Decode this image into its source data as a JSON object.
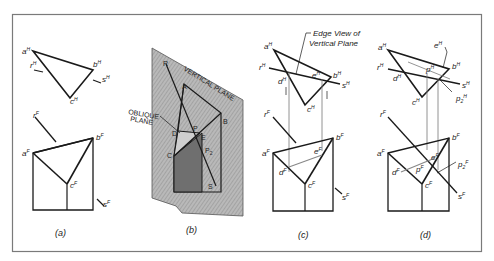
{
  "figure": {
    "frame": {
      "x": 12,
      "y": 14,
      "width": 470,
      "height": 238,
      "stroke": "#777777"
    },
    "panels": [
      {
        "id": "a",
        "caption": "(a)",
        "horizontal_view": {
          "points": {
            "aH": [
              34,
              50
            ],
            "bH": [
              93,
              69
            ],
            "cH": [
              69,
              97
            ]
          },
          "labels": [
            {
              "text": "a",
              "sup": "H"
            },
            {
              "text": "b",
              "sup": "H"
            },
            {
              "text": "c",
              "sup": "H"
            },
            {
              "text": "r",
              "sup": "H"
            },
            {
              "text": "s",
              "sup": "H"
            }
          ]
        },
        "frontal_view": {
          "labels": [
            {
              "text": "a",
              "sup": "F"
            },
            {
              "text": "b",
              "sup": "F"
            },
            {
              "text": "c",
              "sup": "F"
            },
            {
              "text": "r",
              "sup": "F"
            },
            {
              "text": "s",
              "sup": "F"
            }
          ]
        }
      },
      {
        "id": "b",
        "caption": "(b)",
        "pictorial": {
          "plane_labels": [
            "VERTICAL PLANE",
            "OBLIQUE PLANE"
          ],
          "point_labels": [
            "R",
            "A",
            "B",
            "C",
            "D",
            "E",
            "P",
            "P2",
            "S"
          ],
          "shade_color": "#8a8a8a"
        }
      },
      {
        "id": "c",
        "caption": "(c)",
        "annotation": [
          "Edge View of",
          "Vertical Plane"
        ],
        "horizontal_view": {
          "labels": [
            {
              "text": "a",
              "sup": "H"
            },
            {
              "text": "b",
              "sup": "H"
            },
            {
              "text": "c",
              "sup": "H"
            },
            {
              "text": "d",
              "sup": "H"
            },
            {
              "text": "e",
              "sup": "H"
            },
            {
              "text": "r",
              "sup": "H"
            },
            {
              "text": "s",
              "sup": "H"
            }
          ]
        },
        "frontal_view": {
          "labels": [
            {
              "text": "a",
              "sup": "F"
            },
            {
              "text": "b",
              "sup": "F"
            },
            {
              "text": "c",
              "sup": "F"
            },
            {
              "text": "d",
              "sup": "F"
            },
            {
              "text": "e",
              "sup": "F"
            },
            {
              "text": "r",
              "sup": "F"
            },
            {
              "text": "s",
              "sup": "F"
            }
          ]
        }
      },
      {
        "id": "d",
        "caption": "(d)",
        "horizontal_view": {
          "labels": [
            {
              "text": "a",
              "sup": "H"
            },
            {
              "text": "b",
              "sup": "H"
            },
            {
              "text": "c",
              "sup": "H"
            },
            {
              "text": "d",
              "sup": "H"
            },
            {
              "text": "e",
              "sup": "H"
            },
            {
              "text": "p",
              "sup": "H"
            },
            {
              "text": "p2",
              "sup": "H"
            },
            {
              "text": "r",
              "sup": "H"
            },
            {
              "text": "s",
              "sup": "H"
            }
          ]
        },
        "frontal_view": {
          "labels": [
            {
              "text": "a",
              "sup": "F"
            },
            {
              "text": "b",
              "sup": "F"
            },
            {
              "text": "c",
              "sup": "F"
            },
            {
              "text": "d",
              "sup": "F"
            },
            {
              "text": "e",
              "sup": "F"
            },
            {
              "text": "p",
              "sup": "F"
            },
            {
              "text": "p2",
              "sup": "F"
            },
            {
              "text": "r",
              "sup": "F"
            },
            {
              "text": "s",
              "sup": "F"
            }
          ]
        }
      }
    ]
  },
  "text": {
    "cap_a": "(a)",
    "cap_b": "(b)",
    "cap_c": "(c)",
    "cap_d": "(d)",
    "edge_view_1": "Edge View of",
    "edge_view_2": "Vertical Plane",
    "vertical_plane": "VERTICAL PLANE",
    "oblique_1": "OBLIQUE",
    "oblique_2": "PLANE",
    "a": "a",
    "b": "b",
    "c": "c",
    "d": "d",
    "e": "e",
    "p": "p",
    "r": "r",
    "s": "s",
    "H": "H",
    "F": "F",
    "p2": "p",
    "two": "2",
    "R": "R",
    "A": "A",
    "B": "B",
    "C": "C",
    "D": "D",
    "E": "E",
    "P": "P",
    "P2": "P",
    "S": "S"
  }
}
